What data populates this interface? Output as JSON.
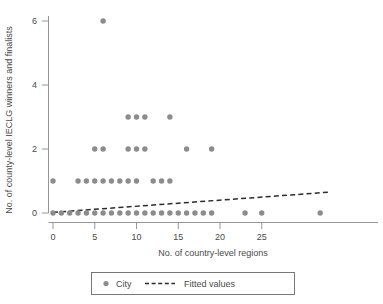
{
  "chart_data": {
    "type": "scatter",
    "title": "",
    "xlabel": "No. of country-level regions",
    "ylabel": "No. of county-level IECLG winners and finalists",
    "xlim": [
      -1.2,
      34
    ],
    "ylim": [
      -0.45,
      6.5
    ],
    "xticks": [
      0,
      5,
      10,
      15,
      20,
      25
    ],
    "yticks": [
      0,
      2,
      4,
      6
    ],
    "grid": false,
    "legend_position": "bottom",
    "series": [
      {
        "name": "City",
        "marker": "circle",
        "color": "#8c8c8c",
        "points": [
          {
            "x": 0,
            "y": 0
          },
          {
            "x": 1,
            "y": 0
          },
          {
            "x": 2,
            "y": 0
          },
          {
            "x": 3,
            "y": 0
          },
          {
            "x": 4,
            "y": 0
          },
          {
            "x": 5,
            "y": 0
          },
          {
            "x": 6,
            "y": 0
          },
          {
            "x": 7,
            "y": 0
          },
          {
            "x": 8,
            "y": 0
          },
          {
            "x": 9,
            "y": 0
          },
          {
            "x": 10,
            "y": 0
          },
          {
            "x": 11,
            "y": 0
          },
          {
            "x": 12,
            "y": 0
          },
          {
            "x": 13,
            "y": 0
          },
          {
            "x": 14,
            "y": 0
          },
          {
            "x": 15,
            "y": 0
          },
          {
            "x": 16,
            "y": 0
          },
          {
            "x": 17,
            "y": 0
          },
          {
            "x": 18,
            "y": 0
          },
          {
            "x": 19,
            "y": 0
          },
          {
            "x": 23,
            "y": 0
          },
          {
            "x": 25,
            "y": 0
          },
          {
            "x": 32,
            "y": 0
          },
          {
            "x": 0,
            "y": 1
          },
          {
            "x": 3,
            "y": 1
          },
          {
            "x": 4,
            "y": 1
          },
          {
            "x": 5,
            "y": 1
          },
          {
            "x": 6,
            "y": 1
          },
          {
            "x": 7,
            "y": 1
          },
          {
            "x": 8,
            "y": 1
          },
          {
            "x": 9,
            "y": 1
          },
          {
            "x": 10,
            "y": 1
          },
          {
            "x": 12,
            "y": 1
          },
          {
            "x": 13,
            "y": 1
          },
          {
            "x": 14,
            "y": 1
          },
          {
            "x": 5,
            "y": 2
          },
          {
            "x": 6,
            "y": 2
          },
          {
            "x": 9,
            "y": 2
          },
          {
            "x": 10,
            "y": 2
          },
          {
            "x": 11,
            "y": 2
          },
          {
            "x": 16,
            "y": 2
          },
          {
            "x": 19,
            "y": 2
          },
          {
            "x": 9,
            "y": 3
          },
          {
            "x": 10,
            "y": 3
          },
          {
            "x": 11,
            "y": 3
          },
          {
            "x": 14,
            "y": 3
          },
          {
            "x": 6,
            "y": 6
          }
        ]
      },
      {
        "name": "Fitted values",
        "type": "line",
        "style": "dashed",
        "color": "#2b2b2b",
        "endpoints": [
          {
            "x": 0,
            "y": 0.02
          },
          {
            "x": 33,
            "y": 0.65
          }
        ]
      }
    ]
  },
  "legend": {
    "items": [
      {
        "label": "City",
        "marker": "circle"
      },
      {
        "label": "Fitted values",
        "marker": "dashed-line"
      }
    ]
  }
}
